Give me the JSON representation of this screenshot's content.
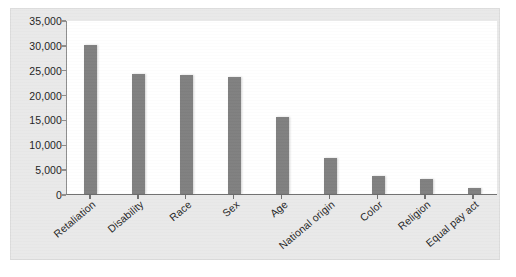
{
  "chart_data": {
    "type": "bar",
    "title": "",
    "subtitle": "",
    "xlabel": "",
    "ylabel": "",
    "categories": [
      "Retaliation",
      "Disability",
      "Race",
      "Sex",
      "Age",
      "National origin",
      "Color",
      "Religion",
      "Equal pay act"
    ],
    "values": [
      30000,
      24200,
      24000,
      23600,
      15400,
      7200,
      3600,
      3000,
      1300
    ],
    "ylim": [
      0,
      35000
    ],
    "ytick_values": [
      0,
      5000,
      10000,
      15000,
      20000,
      25000,
      30000,
      35000
    ],
    "ytick_labels": [
      "0",
      "5,000",
      "10,000",
      "15,000",
      "20,000",
      "25,000",
      "30,000",
      "35,000"
    ],
    "grid": false,
    "legend": null,
    "legend_position": "none",
    "bar_color": "#7f7f7f",
    "plot_background": "#ffffff",
    "figure_background": "#e9e9e9",
    "axis_color": "#6f6f6f",
    "tick_label_color": "#1d1d1d",
    "xtick_label_rotation_deg": -40
  }
}
